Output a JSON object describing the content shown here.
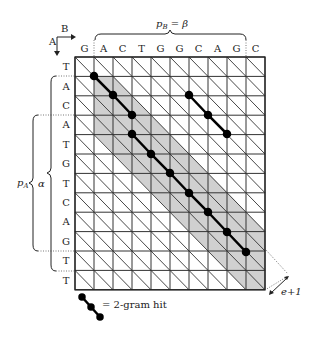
{
  "axes": {
    "a_label": "A",
    "b_label": "B"
  },
  "sequences": {
    "b": [
      "G",
      "A",
      "C",
      "T",
      "G",
      "G",
      "C",
      "A",
      "G",
      "C"
    ],
    "a": [
      "T",
      "A",
      "C",
      "A",
      "T",
      "G",
      "T",
      "C",
      "A",
      "G",
      "T",
      "T"
    ]
  },
  "braces": {
    "top": "p_B = β",
    "top_main": "p",
    "top_sub": "B",
    "top_eq": " = β",
    "left_outer_main": "p",
    "left_outer_sub": "A",
    "left_inner": "α"
  },
  "band_width_label": "e+1",
  "legend": {
    "text": "= 2-gram hit"
  },
  "colors": {
    "band": "#d0d0d0",
    "grid": "#333333",
    "hit": "#000000"
  }
}
